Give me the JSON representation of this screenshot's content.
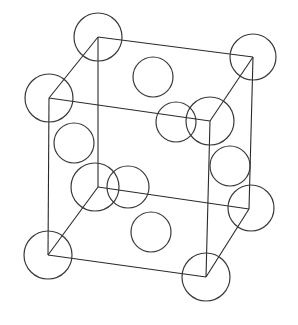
{
  "diagram": {
    "type": "crystal-lattice-unit-cell",
    "colors": {
      "line": "#2a2a2a",
      "atom_outline": "#3a3a3a",
      "background": "#ffffff"
    },
    "vertices": {
      "back_top_left": [
        98,
        37
      ],
      "back_top_right": [
        253,
        57
      ],
      "front_top_left": [
        49,
        98
      ],
      "front_top_right": [
        210,
        121
      ],
      "back_bottom_left": [
        98,
        187
      ],
      "back_bottom_right": [
        249,
        209
      ],
      "front_bottom_left": [
        48,
        255
      ],
      "front_bottom_right": [
        206,
        277
      ]
    },
    "corner_atoms": [
      {
        "name": "back-top-left",
        "cx": 98,
        "cy": 37,
        "r": 24
      },
      {
        "name": "back-top-right",
        "cx": 253,
        "cy": 57,
        "r": 23
      },
      {
        "name": "front-top-left",
        "cx": 49,
        "cy": 98,
        "r": 24
      },
      {
        "name": "front-top-right",
        "cx": 210,
        "cy": 121,
        "r": 24
      },
      {
        "name": "back-bottom-left",
        "cx": 95,
        "cy": 187,
        "r": 24
      },
      {
        "name": "back-bottom-right",
        "cx": 251,
        "cy": 208,
        "r": 23
      },
      {
        "name": "front-bottom-left",
        "cx": 48,
        "cy": 255,
        "r": 24
      },
      {
        "name": "front-bottom-right",
        "cx": 206,
        "cy": 277,
        "r": 24
      }
    ],
    "face_atoms": [
      {
        "name": "top-face",
        "cx": 153,
        "cy": 77,
        "r": 20
      },
      {
        "name": "front-face",
        "cx": 176,
        "cy": 122,
        "r": 20
      },
      {
        "name": "left-face",
        "cx": 74,
        "cy": 143,
        "r": 20
      },
      {
        "name": "right-face",
        "cx": 230,
        "cy": 166,
        "r": 20
      },
      {
        "name": "back-face",
        "cx": 128,
        "cy": 187,
        "r": 21
      },
      {
        "name": "bottom-face",
        "cx": 151,
        "cy": 232,
        "r": 20
      }
    ]
  }
}
